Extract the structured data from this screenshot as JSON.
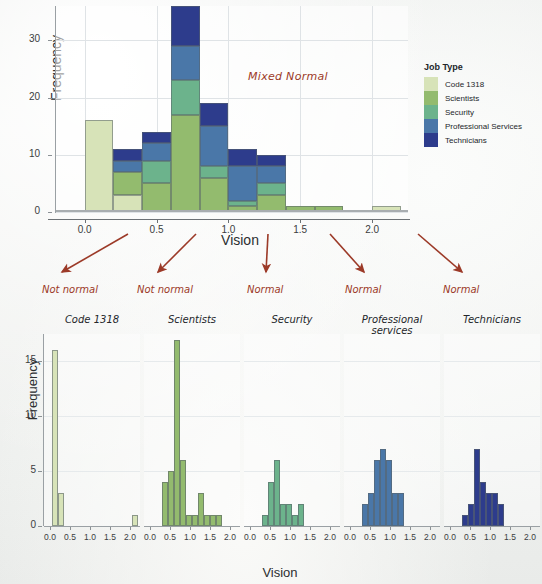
{
  "colors": {
    "code1318": "#d7e3b8",
    "scientists": "#93bb6e",
    "security": "#6cb38c",
    "professional": "#4a77a8",
    "technicians": "#2d3c8c",
    "annotation": "#9c3a28",
    "axis": "#6c7175",
    "grid": "#dfe3e6",
    "text": "#23262a"
  },
  "legend": {
    "title": "Job Type",
    "items": [
      {
        "label": "Code 1318",
        "color": "#d7e3b8"
      },
      {
        "label": "Scientists",
        "color": "#93bb6e"
      },
      {
        "label": "Security",
        "color": "#6cb38c"
      },
      {
        "label": "Professional Services",
        "color": "#4a77a8"
      },
      {
        "label": "Technicians",
        "color": "#2d3c8c"
      }
    ]
  },
  "annotations": {
    "mixed_normal": "Mixed Normal",
    "normality": [
      {
        "text": "Not normal",
        "x": 42,
        "arrow": {
          "x1": 128,
          "y1": 6,
          "x2": 62,
          "y2": 44
        }
      },
      {
        "text": "Not normal",
        "x": 137,
        "arrow": {
          "x1": 196,
          "y1": 6,
          "x2": 158,
          "y2": 44
        }
      },
      {
        "text": "Normal",
        "x": 247,
        "arrow": {
          "x1": 268,
          "y1": 6,
          "x2": 266,
          "y2": 44
        }
      },
      {
        "text": "Normal",
        "x": 345,
        "arrow": {
          "x1": 330,
          "y1": 6,
          "x2": 364,
          "y2": 44
        }
      },
      {
        "text": "Normal",
        "x": 443,
        "arrow": {
          "x1": 418,
          "y1": 6,
          "x2": 462,
          "y2": 44
        }
      }
    ]
  },
  "chart_data": [
    {
      "id": "stacked-histogram",
      "type": "bar",
      "title": "",
      "xlabel": "Vision",
      "ylabel": "Frequency",
      "xlim": [
        -0.2,
        2.25
      ],
      "ylim": [
        0,
        36
      ],
      "xticks": [
        "0.0",
        "0.5",
        "1.0",
        "1.5",
        "2.0"
      ],
      "xtick_values": [
        0.0,
        0.5,
        1.0,
        1.5,
        2.0
      ],
      "yticks": [
        "0",
        "10",
        "20",
        "30"
      ],
      "ytick_values": [
        0,
        10,
        20,
        30
      ],
      "grid": true,
      "stacked": true,
      "legend_position": "right",
      "bin_width": 0.2,
      "bin_starts": [
        0.0,
        0.2,
        0.4,
        0.6,
        0.8,
        1.0,
        1.2,
        1.4,
        1.6,
        1.8,
        2.0
      ],
      "series": [
        {
          "name": "Code 1318",
          "color": "#d7e3b8",
          "values": [
            16,
            3,
            0,
            0,
            0,
            0,
            0,
            0,
            0,
            0,
            1
          ]
        },
        {
          "name": "Scientists",
          "color": "#93bb6e",
          "values": [
            0,
            4,
            5,
            17,
            6,
            1,
            3,
            1,
            1,
            0,
            0
          ]
        },
        {
          "name": "Security",
          "color": "#6cb38c",
          "values": [
            0,
            0,
            4,
            6,
            2,
            1,
            2,
            0,
            0,
            0,
            0
          ]
        },
        {
          "name": "Professional Services",
          "color": "#4a77a8",
          "values": [
            0,
            2,
            3,
            6,
            7,
            6,
            3,
            0,
            0,
            0,
            0
          ]
        },
        {
          "name": "Technicians",
          "color": "#2d3c8c",
          "values": [
            0,
            2,
            2,
            7,
            4,
            3,
            2,
            0,
            0,
            0,
            0
          ]
        }
      ],
      "totals": [
        16,
        11,
        14,
        36,
        19,
        11,
        10,
        1,
        1,
        0,
        1
      ]
    },
    {
      "id": "facet-code1318",
      "type": "bar",
      "title": "Code 1318",
      "color": "#d7e3b8",
      "xlabel": "Vision",
      "ylabel": "Frequency",
      "xticks": [
        "0.0",
        "0.5",
        "1.0",
        "1.5",
        "2.0"
      ],
      "yticks": [
        "0",
        "5",
        "10",
        "15"
      ],
      "ylim": [
        0,
        17.5
      ],
      "xlim": [
        -0.15,
        2.25
      ],
      "bin_width": 0.15,
      "bins": [
        {
          "x": 0.05,
          "value": 16
        },
        {
          "x": 0.2,
          "value": 3
        },
        {
          "x": 2.05,
          "value": 1
        }
      ]
    },
    {
      "id": "facet-scientists",
      "type": "bar",
      "title": "Scientists",
      "color": "#93bb6e",
      "xlabel": "Vision",
      "ylabel": "Frequency",
      "xticks": [
        "0.0",
        "0.5",
        "1.0",
        "1.5",
        "2.0"
      ],
      "yticks": [
        "0",
        "5",
        "10",
        "15"
      ],
      "ylim": [
        0,
        17.5
      ],
      "xlim": [
        -0.15,
        2.25
      ],
      "bin_width": 0.15,
      "bins": [
        {
          "x": 0.3,
          "value": 4
        },
        {
          "x": 0.45,
          "value": 5
        },
        {
          "x": 0.6,
          "value": 17
        },
        {
          "x": 0.75,
          "value": 6
        },
        {
          "x": 0.9,
          "value": 1
        },
        {
          "x": 1.05,
          "value": 1
        },
        {
          "x": 1.2,
          "value": 3
        },
        {
          "x": 1.35,
          "value": 1
        },
        {
          "x": 1.5,
          "value": 1
        },
        {
          "x": 1.65,
          "value": 1
        }
      ]
    },
    {
      "id": "facet-security",
      "type": "bar",
      "title": "Security",
      "color": "#6cb38c",
      "xlabel": "Vision",
      "ylabel": "Frequency",
      "xticks": [
        "0.0",
        "0.5",
        "1.0",
        "1.5",
        "2.0"
      ],
      "yticks": [
        "0",
        "5",
        "10",
        "15"
      ],
      "ylim": [
        0,
        17.5
      ],
      "xlim": [
        -0.15,
        2.25
      ],
      "bin_width": 0.15,
      "bins": [
        {
          "x": 0.3,
          "value": 1
        },
        {
          "x": 0.45,
          "value": 4
        },
        {
          "x": 0.6,
          "value": 6
        },
        {
          "x": 0.75,
          "value": 2
        },
        {
          "x": 0.9,
          "value": 2
        },
        {
          "x": 1.05,
          "value": 1
        },
        {
          "x": 1.2,
          "value": 2
        }
      ]
    },
    {
      "id": "facet-professional-services",
      "type": "bar",
      "title": "Professional services",
      "color": "#4a77a8",
      "xlabel": "Vision",
      "ylabel": "Frequency",
      "xticks": [
        "0.0",
        "0.5",
        "1.0",
        "1.5",
        "2.0"
      ],
      "yticks": [
        "0",
        "5",
        "10",
        "15"
      ],
      "ylim": [
        0,
        17.5
      ],
      "xlim": [
        -0.15,
        2.25
      ],
      "bin_width": 0.15,
      "bins": [
        {
          "x": 0.3,
          "value": 2
        },
        {
          "x": 0.45,
          "value": 3
        },
        {
          "x": 0.6,
          "value": 6
        },
        {
          "x": 0.75,
          "value": 7
        },
        {
          "x": 0.9,
          "value": 6
        },
        {
          "x": 1.05,
          "value": 3
        },
        {
          "x": 1.2,
          "value": 3
        }
      ]
    },
    {
      "id": "facet-technicians",
      "type": "bar",
      "title": "Technicians",
      "color": "#2d3c8c",
      "xlabel": "Vision",
      "ylabel": "Frequency",
      "xticks": [
        "0.0",
        "0.5",
        "1.0",
        "1.5",
        "2.0"
      ],
      "yticks": [
        "0",
        "5",
        "10",
        "15"
      ],
      "ylim": [
        0,
        17.5
      ],
      "xlim": [
        -0.15,
        2.25
      ],
      "bin_width": 0.15,
      "bins": [
        {
          "x": 0.3,
          "value": 1
        },
        {
          "x": 0.45,
          "value": 2
        },
        {
          "x": 0.6,
          "value": 7
        },
        {
          "x": 0.75,
          "value": 4
        },
        {
          "x": 0.9,
          "value": 3
        },
        {
          "x": 1.05,
          "value": 3
        },
        {
          "x": 1.2,
          "value": 2
        }
      ]
    }
  ]
}
